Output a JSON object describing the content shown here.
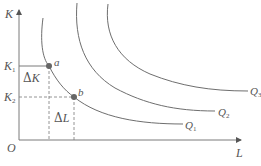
{
  "diagram": {
    "type": "isoquant-map",
    "axes": {
      "y_label": "K",
      "x_label": "L",
      "origin_label": "O"
    },
    "levels": {
      "k1": {
        "main": "K",
        "sub": "1"
      },
      "k2": {
        "main": "K",
        "sub": "2"
      }
    },
    "points": {
      "a": "a",
      "b": "b"
    },
    "deltas": {
      "delta_k": {
        "symbol": "Δ",
        "var": "K"
      },
      "delta_l": {
        "symbol": "Δ",
        "var": "L"
      }
    },
    "curves": [
      {
        "main": "Q",
        "sub": "1"
      },
      {
        "main": "Q",
        "sub": "2"
      },
      {
        "main": "Q",
        "sub": "3"
      }
    ],
    "colors": {
      "line": "#7a7a7a",
      "curve": "#6e6e6e",
      "point": "#666666",
      "text": "#555555"
    }
  }
}
